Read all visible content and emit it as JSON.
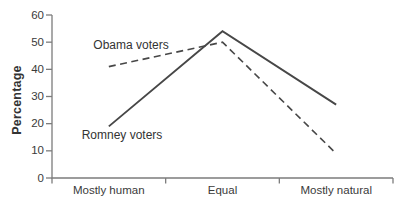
{
  "chart_data": {
    "type": "line",
    "categories": [
      "Mostly human",
      "Equal",
      "Mostly natural"
    ],
    "series": [
      {
        "name": "Obama voters",
        "style": "dashed",
        "values": [
          41,
          50,
          9
        ]
      },
      {
        "name": "Romney voters",
        "style": "solid",
        "values": [
          19,
          54,
          27
        ]
      }
    ],
    "title": "",
    "xlabel": "",
    "ylabel": "Percentage",
    "ylim": [
      0,
      60
    ],
    "yticks": [
      60,
      50,
      40,
      30,
      20,
      10,
      0
    ],
    "grid": false,
    "legend_position": "inline-annotations"
  },
  "colors": {
    "line": "#474747",
    "axis": "#7c7c7c",
    "text": "#3a3a3a",
    "background": "#ffffff"
  }
}
